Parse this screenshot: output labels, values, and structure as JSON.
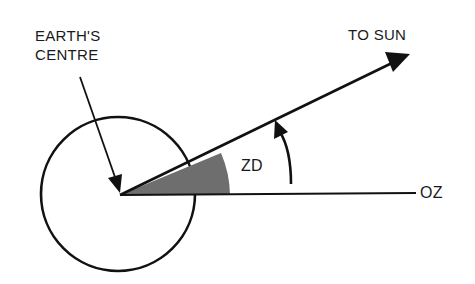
{
  "diagram": {
    "labels": {
      "earth_centre_line1": "EARTH'S",
      "earth_centre_line2": "CENTRE",
      "to_sun": "TO SUN",
      "zenith_distance": "ZD",
      "oz": "OZ"
    },
    "colors": {
      "stroke": "#111111",
      "wedge_fill": "#6e6e6e",
      "background": "#ffffff"
    },
    "geometry": {
      "earth_circle": {
        "cx": 118,
        "cy": 194,
        "r": 77
      },
      "origin": {
        "x": 120,
        "y": 195
      },
      "oz_line_end": {
        "x": 416,
        "y": 193
      },
      "sun_arrow_tip": {
        "x": 410,
        "y": 54
      },
      "zd_wedge_radius": 110
    }
  }
}
